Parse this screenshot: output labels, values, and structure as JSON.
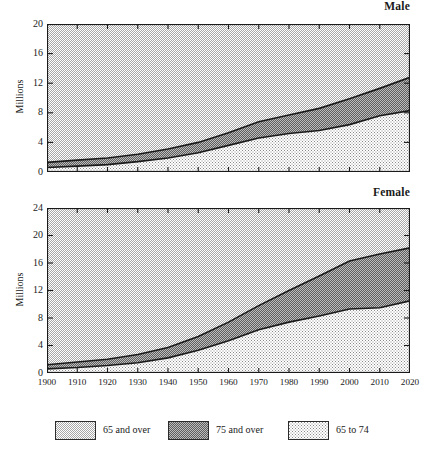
{
  "figure": {
    "y_axis_label": "Millions",
    "legend": [
      {
        "label": "65 and over",
        "pattern": "pat-light",
        "swatch_color": "#d4d4d4"
      },
      {
        "label": "75 and over",
        "pattern": "pat-dark",
        "swatch_color": "#9e9e9e"
      },
      {
        "label": "65 to 74",
        "pattern": "pat-dot",
        "swatch_color": "#e8e8e8"
      }
    ]
  },
  "chart_data": [
    {
      "type": "area",
      "title": "Male",
      "xlabel": "",
      "ylabel": "Millions",
      "stacked": true,
      "grid": false,
      "legend_position": "bottom",
      "xlim": [
        1900,
        2020
      ],
      "ylim": [
        0,
        20
      ],
      "yticks": [
        0,
        4,
        8,
        12,
        16,
        20
      ],
      "xticks": [
        1900,
        1910,
        1920,
        1930,
        1940,
        1950,
        1960,
        1970,
        1980,
        1990,
        2000,
        2010,
        2020
      ],
      "x": [
        1900,
        1910,
        1920,
        1930,
        1940,
        1950,
        1960,
        1970,
        1980,
        1990,
        2000,
        2010,
        2020
      ],
      "series": [
        {
          "name": "65 to 74",
          "values": [
            0.6,
            0.8,
            1.0,
            1.4,
            1.9,
            2.6,
            3.6,
            4.6,
            5.2,
            5.6,
            6.4,
            7.6,
            8.3,
            12.1
          ]
        },
        {
          "name": "75 and over",
          "values": [
            1.3,
            1.6,
            1.9,
            2.4,
            3.1,
            4.0,
            5.3,
            6.8,
            7.7,
            8.6,
            9.9,
            11.3,
            12.8,
            18.4
          ]
        }
      ],
      "series_65to74": [
        0.6,
        0.8,
        1.0,
        1.4,
        1.9,
        2.6,
        3.6,
        4.6,
        5.2,
        5.6,
        6.4,
        7.6,
        8.3,
        12.1
      ],
      "series_65andover": [
        1.3,
        1.6,
        1.9,
        2.4,
        3.1,
        4.0,
        5.3,
        6.8,
        7.7,
        8.6,
        9.9,
        11.3,
        12.8,
        18.4
      ]
    },
    {
      "type": "area",
      "title": "Female",
      "xlabel": "",
      "ylabel": "Millions",
      "stacked": true,
      "grid": false,
      "legend_position": "bottom",
      "xlim": [
        1900,
        2020
      ],
      "ylim": [
        0,
        24
      ],
      "yticks": [
        0,
        4,
        8,
        12,
        16,
        20,
        24
      ],
      "xticks": [
        1900,
        1910,
        1920,
        1930,
        1940,
        1950,
        1960,
        1970,
        1980,
        1990,
        2000,
        2010,
        2020
      ],
      "x": [
        1900,
        1910,
        1920,
        1930,
        1940,
        1950,
        1960,
        1970,
        1980,
        1990,
        2000,
        2010,
        2020
      ],
      "series": [
        {
          "name": "65 to 74",
          "values": [
            0.6,
            0.8,
            1.1,
            1.5,
            2.2,
            3.3,
            4.7,
            6.3,
            7.4,
            8.3,
            9.3,
            9.5,
            10.5,
            14.2
          ]
        },
        {
          "name": "75 and over",
          "values": [
            1.2,
            1.6,
            2.0,
            2.7,
            3.7,
            5.3,
            7.4,
            9.8,
            12.0,
            14.1,
            16.3,
            17.3,
            18.2,
            23.8
          ]
        }
      ],
      "series_65to74": [
        0.6,
        0.8,
        1.1,
        1.5,
        2.2,
        3.3,
        4.7,
        6.3,
        7.4,
        8.3,
        9.3,
        9.5,
        10.5,
        14.2
      ],
      "series_65andover": [
        1.2,
        1.6,
        2.0,
        2.7,
        3.7,
        5.3,
        7.4,
        9.8,
        12.0,
        14.1,
        16.3,
        17.3,
        18.2,
        23.8
      ]
    }
  ]
}
